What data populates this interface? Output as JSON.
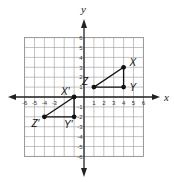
{
  "figure": {
    "type": "coordinate-plane",
    "x_axis_label": "x",
    "y_axis_label": "y",
    "x_range": [
      -6,
      6
    ],
    "y_range": [
      -6,
      6
    ],
    "x_tick_labels": [
      "-6",
      "-5",
      "-4",
      "-3",
      "1",
      "2",
      "3",
      "4",
      "5",
      "6"
    ],
    "x_ticks": [
      -6,
      -5,
      -4,
      -3,
      1,
      2,
      3,
      4,
      5,
      6
    ],
    "y_tick_labels": [
      "6",
      "5",
      "4",
      "3",
      "2",
      "1",
      "-1",
      "-2",
      "-3",
      "-4",
      "-5",
      "-6"
    ],
    "y_ticks": [
      6,
      5,
      4,
      3,
      2,
      1,
      -1,
      -2,
      -3,
      -4,
      -5,
      -6
    ],
    "grid": true
  },
  "triangles": [
    {
      "name": "XYZ",
      "vertices": [
        {
          "label": "X",
          "x": 4,
          "y": 3
        },
        {
          "label": "Y",
          "x": 4,
          "y": 1
        },
        {
          "label": "Z",
          "x": 1,
          "y": 1
        }
      ]
    },
    {
      "name": "X'Y'Z'",
      "vertices": [
        {
          "label": "X′",
          "x": -1,
          "y": 0
        },
        {
          "label": "Y′",
          "x": -1,
          "y": -2
        },
        {
          "label": "Z′",
          "x": -4,
          "y": -2
        }
      ]
    }
  ],
  "colors": {
    "line": "#111111",
    "grid": "#9a9a9a"
  }
}
